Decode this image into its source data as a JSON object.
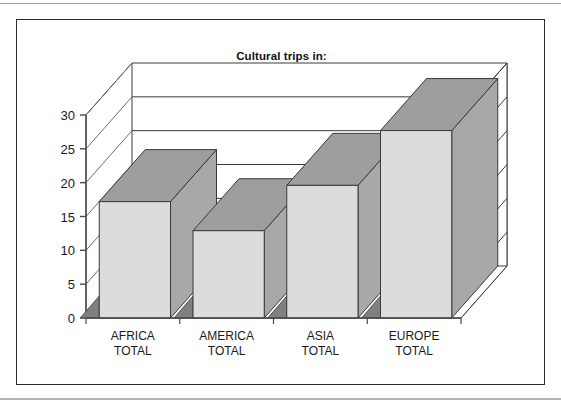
{
  "figure": {
    "title": "Cultural trips in:"
  },
  "chart_data": {
    "type": "bar",
    "style": "3d-column",
    "title": "Cultural trips in:",
    "categories": [
      "AFRICA TOTAL",
      "AMERICA TOTAL",
      "ASIA TOTAL",
      "EUROPE TOTAL"
    ],
    "category_lines": [
      [
        "AFRICA",
        "TOTAL"
      ],
      [
        "AMERICA",
        "TOTAL"
      ],
      [
        "ASIA",
        "TOTAL"
      ],
      [
        "EUROPE",
        "TOTAL"
      ]
    ],
    "values": [
      17.2,
      12.9,
      19.6,
      27.7
    ],
    "xlabel": "",
    "ylabel": "",
    "ylim": [
      0,
      30
    ],
    "ytick_labels": [
      "0",
      "5",
      "10",
      "15",
      "20",
      "25",
      "30"
    ],
    "ytick_values": [
      0,
      5,
      10,
      15,
      20,
      25,
      30
    ],
    "grid": true,
    "legend": false,
    "colors": {
      "bar_front": "#dcdcdc",
      "bar_top": "#9e9e9e",
      "bar_side": "#a8a8a8",
      "bar_shadow": "#808080",
      "outline": "#3a3a3a",
      "frame": "#2b2b2b",
      "text": "#1a1a1a",
      "background": "#ffffff"
    }
  },
  "axis": {
    "y_ticks": [
      {
        "label": "30",
        "value": 30
      },
      {
        "label": "25",
        "value": 25
      },
      {
        "label": "20",
        "value": 20
      },
      {
        "label": "15",
        "value": 15
      },
      {
        "label": "10",
        "value": 10
      },
      {
        "label": "5",
        "value": 5
      },
      {
        "label": "0",
        "value": 0
      }
    ]
  },
  "bars": [
    {
      "line1": "AFRICA",
      "line2": "TOTAL",
      "value": 17.2
    },
    {
      "line1": "AMERICA",
      "line2": "TOTAL",
      "value": 12.9
    },
    {
      "line1": "ASIA",
      "line2": "TOTAL",
      "value": 19.6
    },
    {
      "line1": "EUROPE",
      "line2": "TOTAL",
      "value": 27.7
    }
  ]
}
